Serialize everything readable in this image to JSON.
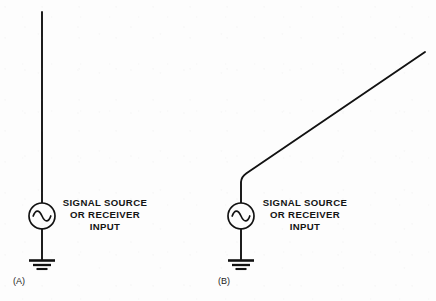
{
  "figure": {
    "background_color": "#fdfdfd",
    "line_color": "#121212",
    "panels": [
      {
        "id": "panel-a",
        "label": "(A)",
        "antenna_type": "vertical",
        "caption_lines": [
          "SIGNAL SOURCE",
          "OR RECEIVER",
          "INPUT"
        ],
        "symbols": [
          "antenna-wire",
          "ac-source",
          "ground"
        ]
      },
      {
        "id": "panel-b",
        "label": "(B)",
        "antenna_type": "bent-sloping",
        "caption_lines": [
          "SIGNAL SOURCE",
          "OR RECEIVER",
          "INPUT"
        ],
        "symbols": [
          "antenna-wire",
          "ac-source",
          "ground"
        ]
      }
    ]
  }
}
